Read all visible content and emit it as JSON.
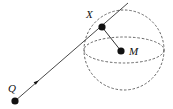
{
  "diagram": {
    "type": "geometry",
    "colors": {
      "stroke": "#333333",
      "dashed": "#555555",
      "point": "#111111",
      "background": "#ffffff"
    },
    "points": {
      "Q": {
        "label": "Q",
        "x": 15,
        "y": 101
      },
      "X": {
        "label": "X",
        "x": 102,
        "y": 27
      },
      "M": {
        "label": "M",
        "x": 121,
        "y": 51
      }
    },
    "labels": {
      "Q": "Q",
      "X": "X",
      "M": "M"
    },
    "sphere": {
      "center": [
        124,
        50
      ],
      "radius": 40,
      "equator_ry": 13,
      "style": "dashed"
    },
    "ray": {
      "from": "Q",
      "through": "X",
      "end": [
        128,
        3
      ],
      "arrow_at": [
        37,
        82
      ]
    },
    "segment": {
      "from": "X",
      "to": "M"
    }
  }
}
